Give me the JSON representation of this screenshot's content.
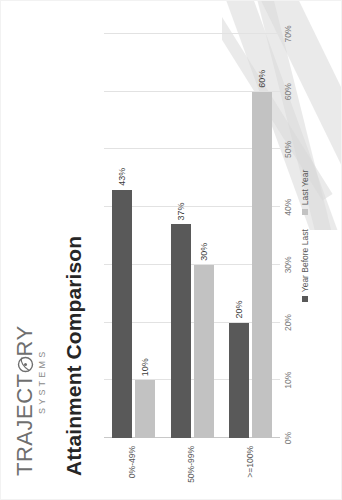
{
  "logo": {
    "name": "TRAJECT",
    "name_tail": "RY",
    "tagline": "SYSTEMS",
    "icon": "circle-swoosh-icon"
  },
  "chart_title": "Attainment Comparison",
  "legend": {
    "position": "bottom-center",
    "items": [
      {
        "label": "Year Before Last",
        "color": "#595959"
      },
      {
        "label": "Last Year",
        "color": "#c2c2c2"
      }
    ]
  },
  "chart_data": {
    "type": "bar",
    "title": "Attainment Comparison",
    "xlabel": "",
    "ylabel": "",
    "categories": [
      "0%-49%",
      "50%-99%",
      ">=100%"
    ],
    "series": [
      {
        "name": "Year Before Last",
        "color": "#595959",
        "values": [
          43,
          37,
          20
        ],
        "labels": [
          "43%",
          "10%",
          "20%"
        ]
      },
      {
        "name": "Last Year",
        "color": "#c2c2c2",
        "values": [
          10,
          30,
          60
        ],
        "labels": [
          "10%",
          "30%",
          "60%"
        ]
      }
    ],
    "data_labels": {
      "0%-49%": {
        "Year Before Last": "43%",
        "Last Year": "10%"
      },
      "50%-99%": {
        "Year Before Last": "37%",
        "Last Year": "30%"
      },
      ">=100%": {
        "Year Before Last": "20%",
        "Last Year": "60%"
      }
    },
    "ylim": [
      0,
      70
    ],
    "ticks": [
      "0%",
      "10%",
      "20%",
      "30%",
      "40%",
      "50%",
      "60%",
      "70%"
    ],
    "tick_values": [
      0,
      10,
      20,
      30,
      40,
      50,
      60,
      70
    ],
    "grid": true,
    "orientation": "vertical"
  },
  "colors": {
    "series_dark": "#595959",
    "series_light": "#c2c2c2",
    "gridline": "#e2e2e2",
    "axis": "#c8c8c8",
    "title": "#262626",
    "tick_text": "#7a7a7a"
  }
}
